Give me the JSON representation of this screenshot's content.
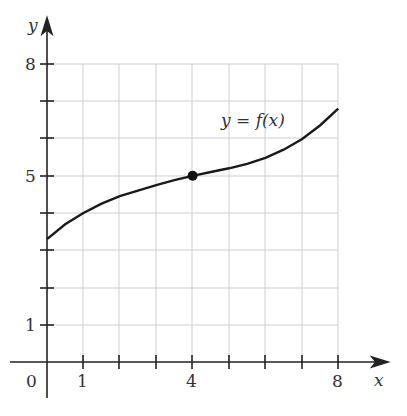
{
  "chart_data": {
    "type": "line",
    "title": "",
    "xlabel": "x",
    "ylabel": "y",
    "annotation": "y = f(x)",
    "x_ticks_labeled": [
      "0",
      "1",
      "4",
      "8"
    ],
    "y_ticks_labeled": [
      "1",
      "5",
      "8"
    ],
    "xlim": [
      0,
      8
    ],
    "ylim": [
      0,
      8
    ],
    "grid": true,
    "series": [
      {
        "name": "y = f(x)",
        "x": [
          0,
          0.5,
          1,
          1.5,
          2,
          2.5,
          3,
          3.5,
          4,
          4.5,
          5,
          5.5,
          6,
          6.5,
          7,
          7.5,
          8
        ],
        "y": [
          3.3,
          3.7,
          4.0,
          4.25,
          4.45,
          4.6,
          4.75,
          4.88,
          5.0,
          5.1,
          5.2,
          5.32,
          5.48,
          5.7,
          5.98,
          6.35,
          6.8
        ]
      }
    ],
    "highlighted_point": {
      "x": 4,
      "y": 5
    }
  },
  "labels": {
    "x_axis": "x",
    "y_axis": "y",
    "origin": "0",
    "x1": "1",
    "x4": "4",
    "x8": "8",
    "y1": "1",
    "y5": "5",
    "y8": "8",
    "curve": "y = f(x)"
  }
}
